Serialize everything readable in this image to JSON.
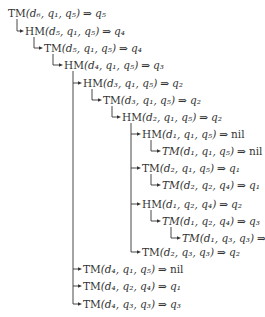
{
  "diagram": {
    "type": "call-tree",
    "arrow_symbol": "⇒",
    "nodes": [
      {
        "id": 0,
        "level": 0,
        "op": "TM",
        "italic": false,
        "args": "(d₆, q₁, q₅)",
        "result": "q₅",
        "parent": null,
        "y": 13
      },
      {
        "id": 1,
        "level": 1,
        "op": "HM",
        "italic": false,
        "args": "(d₅, q₁, q₅)",
        "result": "q₄",
        "parent": 0,
        "y": 31
      },
      {
        "id": 2,
        "level": 2,
        "op": "TM",
        "italic": false,
        "args": "(d₅, q₁, q₅)",
        "result": "q₄",
        "parent": 1,
        "y": 48
      },
      {
        "id": 3,
        "level": 3,
        "op": "HM",
        "italic": false,
        "args": "(d₄, q₁, q₅)",
        "result": "q₃",
        "parent": 2,
        "y": 65
      },
      {
        "id": 4,
        "level": 4,
        "op": "HM",
        "italic": false,
        "args": "(d₃, q₁, q₅)",
        "result": "q₂",
        "parent": 3,
        "y": 83
      },
      {
        "id": 5,
        "level": 5,
        "op": "TM",
        "italic": false,
        "args": "(d₃, q₁, q₅)",
        "result": "q₂",
        "parent": 4,
        "y": 100
      },
      {
        "id": 6,
        "level": 6,
        "op": "HM",
        "italic": false,
        "args": "(d₂, q₁, q₅)",
        "result": "q₂",
        "parent": 5,
        "y": 117
      },
      {
        "id": 7,
        "level": 7,
        "op": "HM",
        "italic": false,
        "args": "(d₁, q₁, q₅)",
        "result": "nil",
        "parent": 6,
        "y": 134
      },
      {
        "id": 8,
        "level": 8,
        "op": "TM",
        "italic": true,
        "args": "(d₁, q₁, q₅)",
        "result": "nil",
        "parent": 7,
        "y": 151
      },
      {
        "id": 9,
        "level": 7,
        "op": "TM",
        "italic": false,
        "args": "(d₂, q₁, q₅)",
        "result": "q₁",
        "parent": 6,
        "y": 168
      },
      {
        "id": 10,
        "level": 8,
        "op": "TM",
        "italic": true,
        "args": "(d₂, q₂, q₄)",
        "result": "q₁",
        "parent": 9,
        "y": 185
      },
      {
        "id": 11,
        "level": 7,
        "op": "HM",
        "italic": false,
        "args": "(d₁, q₂, q₄)",
        "result": "q₂",
        "parent": 6,
        "y": 204
      },
      {
        "id": 12,
        "level": 8,
        "op": "TM",
        "italic": true,
        "args": "(d₁, q₂, q₄)",
        "result": "q₃",
        "parent": 11,
        "y": 221
      },
      {
        "id": 13,
        "level": 9,
        "op": "TM",
        "italic": true,
        "args": "(d₁, q₃, q₃)",
        "result": "q₂",
        "parent": 12,
        "y": 238
      },
      {
        "id": 14,
        "level": 7,
        "op": "TM",
        "italic": false,
        "args": "(d₂, q₃, q₃)",
        "result": "q₂",
        "parent": 6,
        "y": 252
      },
      {
        "id": 15,
        "level": 4,
        "op": "TM",
        "italic": false,
        "args": "(d₄, q₁, q₅)",
        "result": "nil",
        "parent": 3,
        "y": 269
      },
      {
        "id": 16,
        "level": 4,
        "op": "TM",
        "italic": false,
        "args": "(d₄, q₂, q₄)",
        "result": "q₁",
        "parent": 3,
        "y": 286
      },
      {
        "id": 17,
        "level": 4,
        "op": "TM",
        "italic": false,
        "args": "(d₄, q₃, q₃)",
        "result": "q₃",
        "parent": 3,
        "y": 304
      }
    ]
  },
  "colors": {
    "text": "#333333",
    "lines": "#333333",
    "background": "#ffffff"
  }
}
